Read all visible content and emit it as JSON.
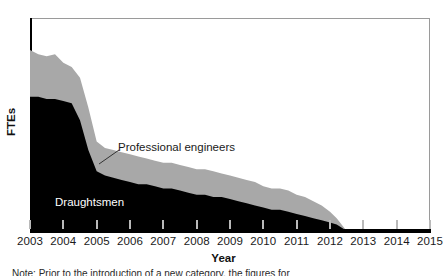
{
  "figure": {
    "background_color": "#ffffff",
    "frame_color": "#9a9a9a",
    "axis_color": "#000000",
    "tick_color": "#b9b9b9"
  },
  "axes": {
    "y_title": "FTEs",
    "x_title": "Year"
  },
  "annotations": {
    "engineers_label": "Professional engineers",
    "draughtsmen_label": "Draughtsmen"
  },
  "caption": {
    "text": "Note: Prior to the introduction of a new category, the figures for"
  },
  "chart_data": {
    "type": "area",
    "title": "",
    "xlabel": "Year",
    "ylabel": "FTEs",
    "stacked": true,
    "grid": false,
    "legend": "inline-annotations",
    "xlim": [
      2003,
      2015
    ],
    "ylim": [
      0,
      100
    ],
    "x_tick_labels": [
      "2003",
      "2004",
      "2005",
      "2006",
      "2007",
      "2008",
      "2009",
      "2010",
      "2011",
      "2012",
      "2013",
      "2014",
      "2015"
    ],
    "y_tick_labels": [],
    "categories": [
      2003.0,
      2003.25,
      2003.5,
      2003.75,
      2004.0,
      2004.25,
      2004.5,
      2004.75,
      2005.0,
      2005.25,
      2005.5,
      2005.75,
      2006.0,
      2006.25,
      2006.5,
      2006.75,
      2007.0,
      2007.25,
      2007.5,
      2007.75,
      2008.0,
      2008.25,
      2008.5,
      2008.75,
      2009.0,
      2009.25,
      2009.5,
      2009.75,
      2010.0,
      2010.25,
      2010.5,
      2010.75,
      2011.0,
      2011.25,
      2011.5,
      2011.75,
      2012.0,
      2012.2,
      2012.4,
      2012.5,
      2015.0
    ],
    "series": [
      {
        "name": "Draughtsmen",
        "color": "#000000",
        "values": [
          63,
          63,
          62,
          62,
          61,
          60,
          52,
          38,
          28,
          26,
          25,
          24,
          23,
          22,
          22,
          21,
          20,
          20,
          19,
          18,
          17,
          17,
          16,
          16,
          15,
          14,
          13,
          12,
          11,
          10,
          10,
          9,
          8,
          7,
          6,
          5,
          4,
          3,
          1,
          0,
          0
        ]
      },
      {
        "name": "Professional engineers",
        "color": "#a8a8a8",
        "values": [
          22,
          20,
          20,
          21,
          18,
          17,
          20,
          20,
          14,
          13,
          13,
          13,
          13,
          13,
          12,
          12,
          12,
          12,
          12,
          12,
          12,
          12,
          12,
          11,
          11,
          11,
          11,
          11,
          10,
          10,
          10,
          10,
          9,
          9,
          8,
          7,
          5,
          3,
          1,
          0,
          0
        ]
      }
    ]
  }
}
